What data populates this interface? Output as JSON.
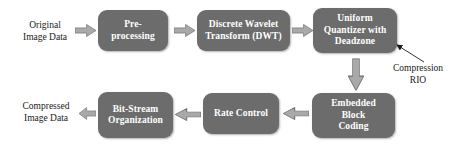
{
  "diagram": {
    "colors": {
      "node_fill": "#6c6c6c",
      "node_text": "#ffffff",
      "arrow_fill": "#a9a9a9",
      "arrow_stroke": "#6f6f6f",
      "label_text": "#1a1a1a",
      "background": "#ffffff"
    },
    "io_labels": [
      {
        "id": "input",
        "text": "Original\nImage Data",
        "x": 14,
        "y": 19,
        "w": 62
      },
      {
        "id": "output",
        "text": "Compressed\nImage Data",
        "x": 11,
        "y": 100,
        "w": 70
      }
    ],
    "nodes": [
      {
        "id": "pre-processing",
        "label": "Pre-\nprocessing",
        "x": 98,
        "y": 10,
        "w": 70,
        "h": 41
      },
      {
        "id": "discrete-wavelet-transform",
        "label": "Discrete Wavelet\nTransform (DWT)",
        "x": 197,
        "y": 10,
        "w": 93,
        "h": 41
      },
      {
        "id": "uniform-quantizer-with-deadzone",
        "label": "Uniform\nQuantizer with\nDeadzone",
        "x": 313,
        "y": 8,
        "w": 84,
        "h": 45
      },
      {
        "id": "embedded-block-coding",
        "label": "Embedded\nBlock\nCoding",
        "x": 312,
        "y": 93,
        "w": 83,
        "h": 45
      },
      {
        "id": "rate-control",
        "label": "Rate Control",
        "x": 203,
        "y": 93,
        "w": 76,
        "h": 41
      },
      {
        "id": "bit-stream-organization",
        "label": "Bit-Stream\nOrganization",
        "x": 98,
        "y": 92,
        "w": 75,
        "h": 46
      }
    ],
    "arrows": [
      {
        "id": "input-to-preprocessing",
        "direction": "right",
        "x": 75,
        "y": 24,
        "w": 21,
        "h": 13
      },
      {
        "id": "preprocessing-to-dwt",
        "direction": "right",
        "x": 174,
        "y": 24,
        "w": 21,
        "h": 13
      },
      {
        "id": "dwt-to-quantizer",
        "direction": "right",
        "x": 292,
        "y": 24,
        "w": 21,
        "h": 13
      },
      {
        "id": "quantizer-to-block-coding",
        "direction": "down",
        "x": 347,
        "y": 58,
        "w": 17,
        "h": 32
      },
      {
        "id": "block-coding-to-rate-control",
        "direction": "left",
        "x": 283,
        "y": 107,
        "w": 26,
        "h": 13
      },
      {
        "id": "rate-control-to-bit-stream",
        "direction": "left",
        "x": 175,
        "y": 108,
        "w": 26,
        "h": 13
      },
      {
        "id": "bit-stream-to-output",
        "direction": "left",
        "x": 79,
        "y": 107,
        "w": 17,
        "h": 13
      }
    ],
    "annotations": [
      {
        "id": "compression-rio",
        "text": "Compression\nRIO",
        "x": 385,
        "y": 62,
        "w": 66,
        "pointer": {
          "x1": 424,
          "y1": 62,
          "x2": 397,
          "y2": 45
        }
      }
    ]
  }
}
